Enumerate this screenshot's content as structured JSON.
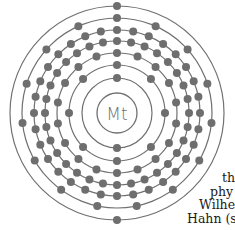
{
  "diagram": {
    "element_symbol": "Mt",
    "center": {
      "x": 117,
      "y": 113
    },
    "nucleus_radius": 20,
    "colors": {
      "stroke": "#707070",
      "electron": "#6e6e6e",
      "background": "#ffffff",
      "text": "#1a1a1a"
    },
    "electron_radius": 4,
    "shells": [
      {
        "n": 1,
        "radius": 35,
        "electrons": 2
      },
      {
        "n": 2,
        "radius": 48,
        "electrons": 8
      },
      {
        "n": 3,
        "radius": 60,
        "electrons": 18
      },
      {
        "n": 4,
        "radius": 72,
        "electrons": 32
      },
      {
        "n": 5,
        "radius": 83,
        "electrons": 32
      },
      {
        "n": 6,
        "radius": 95,
        "electrons": 15
      },
      {
        "n": 7,
        "radius": 107,
        "electrons": 2
      }
    ]
  },
  "text_fragments": [
    {
      "text": "th",
      "x": 222,
      "y": 172
    },
    {
      "text": "phy",
      "x": 210,
      "y": 186
    },
    {
      "text": "Wilhe",
      "x": 199,
      "y": 199
    },
    {
      "text": "Hahn  (se",
      "x": 187,
      "y": 213
    }
  ]
}
